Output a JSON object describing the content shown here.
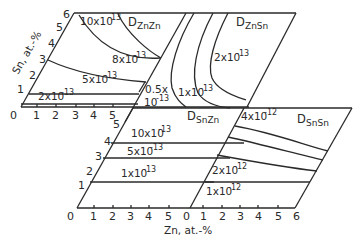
{
  "figure": {
    "type": "diffusion-coefficient-composition-maps",
    "panels": [
      {
        "id": "ZnZn",
        "title": "D",
        "subscript": "ZnZn",
        "contours": [
          {
            "base": "10x10",
            "exp": "-13"
          },
          {
            "base": "8x10",
            "exp": "-13"
          },
          {
            "base": "5x10",
            "exp": "-13"
          },
          {
            "base": "2x10",
            "exp": "-13"
          },
          {
            "base": "0.5x",
            "exp": "-13",
            "line2": "10"
          }
        ]
      },
      {
        "id": "ZnSn",
        "title": "D",
        "subscript": "ZnSn",
        "contours": [
          {
            "base": "2x10",
            "exp": "-13"
          },
          {
            "base": "1x10",
            "exp": "-13"
          }
        ]
      },
      {
        "id": "SnZn",
        "title": "D",
        "subscript": "SnZn",
        "contours": [
          {
            "base": "10x10",
            "exp": "-13"
          },
          {
            "base": "5x10",
            "exp": "-13"
          },
          {
            "base": "1x10",
            "exp": "-13"
          }
        ]
      },
      {
        "id": "SnSn",
        "title": "D",
        "subscript": "SnSn",
        "contours": [
          {
            "base": "4x10",
            "exp": "-12"
          },
          {
            "base": "2x10",
            "exp": "-12"
          },
          {
            "base": "1x10",
            "exp": "-12"
          }
        ]
      }
    ],
    "axes": {
      "y_label": "Sn, at.-%",
      "x_label": "Zn, at.-%",
      "top_y_ticks": [
        "1",
        "2",
        "3",
        "4",
        "5",
        "6"
      ],
      "top_x_ticks": [
        "0",
        "1",
        "2",
        "3",
        "4",
        "5"
      ],
      "bottom_y_ticks": [
        "1",
        "2",
        "3",
        "4",
        "5"
      ],
      "bottom_x_ticks_left": [
        "0",
        "1",
        "2",
        "3",
        "4",
        "5"
      ],
      "bottom_x_ticks_right": [
        "0",
        "1",
        "2",
        "3",
        "4",
        "5",
        "6"
      ]
    }
  }
}
